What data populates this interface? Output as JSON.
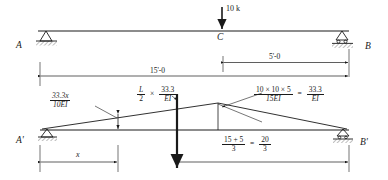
{
  "figure": {
    "colors": {
      "ink": "#1a1a1a",
      "hatch": "#555555"
    }
  },
  "beam": {
    "left_support_label": "A",
    "right_support_label": "B",
    "midpoint_label": "C",
    "left_support_type": "pin",
    "right_support_type": "roller",
    "load": {
      "label": "10 k",
      "magnitude": 10,
      "unit": "k",
      "direction": "down"
    },
    "dimensions": [
      {
        "name": "span-A-to-C",
        "label": "15'-0",
        "value": 15,
        "unit": "ft"
      },
      {
        "name": "span-C-to-B",
        "label": "5'-0",
        "value": 5,
        "unit": "ft"
      }
    ]
  },
  "conjugate": {
    "left_support_label": "A'",
    "right_support_label": "B'",
    "left_ordinate": {
      "numerator": "33.3x",
      "denominator": "10EI"
    },
    "resultant": {
      "lead": "L",
      "lead_den": "2",
      "times": "×",
      "numerator": "33.3",
      "denominator": "EI"
    },
    "peak": {
      "numerator": "10 × 10 × 5",
      "denominator": "15EI",
      "equals": "=",
      "result_num": "33.3",
      "result_den": "EI"
    },
    "right_dimension": {
      "numerator": "15 + 5",
      "denominator": "3",
      "equals": "=",
      "result_num": "20",
      "result_den": "3"
    },
    "x_dimension_label": "x"
  }
}
